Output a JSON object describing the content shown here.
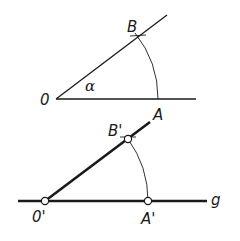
{
  "diagram": {
    "type": "angle-transfer-construction",
    "colors": {
      "stroke": "#1a1a1a",
      "background": "#ffffff"
    },
    "top_figure": {
      "labels": {
        "vertex": "0",
        "ray_point": "B",
        "base_point": "A",
        "angle": "α"
      }
    },
    "bottom_figure": {
      "labels": {
        "vertex": "0'",
        "ray_point": "B'",
        "base_point": "A'",
        "line": "g"
      }
    }
  }
}
